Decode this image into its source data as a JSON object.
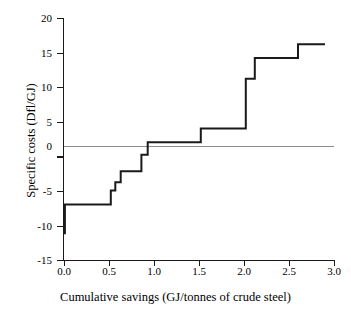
{
  "chart_data": {
    "type": "line",
    "subtype": "step-post",
    "title": "",
    "xlabel": "Cumulative savings (GJ/tonnes of crude steel)",
    "ylabel": "Specific costs (Dfl/GJ)",
    "xlim": [
      0.0,
      3.0
    ],
    "ylim": [
      -15,
      20
    ],
    "xticks": [
      "0.0",
      "0.5",
      "1.0",
      "1.5",
      "2.0",
      "2.5",
      "3.0"
    ],
    "xtick_values": [
      0.0,
      0.5,
      1.0,
      1.5,
      2.0,
      2.5,
      3.0
    ],
    "yticks": [
      "20",
      "15",
      "10",
      "5",
      "0",
      "-5",
      "-10",
      "-15"
    ],
    "ytick_values": [
      20,
      15,
      10,
      5,
      0,
      -5,
      -10,
      -15
    ],
    "grid": false,
    "legend": false,
    "zero_reference_line": true,
    "zero_reference_color": "#8c8c8c",
    "line_color": "#1a1a1a",
    "axis_color": "#1a1a1a",
    "background_color": "#ffffff",
    "steps": [
      {
        "x_start": 0.0,
        "x_end": 0.01,
        "y": -11.2
      },
      {
        "x_start": 0.01,
        "x_end": 0.52,
        "y": -7.0
      },
      {
        "x_start": 0.52,
        "x_end": 0.57,
        "y": -5.0
      },
      {
        "x_start": 0.57,
        "x_end": 0.63,
        "y": -3.8
      },
      {
        "x_start": 0.63,
        "x_end": 0.86,
        "y": -2.2
      },
      {
        "x_start": 0.86,
        "x_end": 0.93,
        "y": 0.2
      },
      {
        "x_start": 0.93,
        "x_end": 1.52,
        "y": 2.0
      },
      {
        "x_start": 1.52,
        "x_end": 2.02,
        "y": 4.0
      },
      {
        "x_start": 2.02,
        "x_end": 2.12,
        "y": 11.2
      },
      {
        "x_start": 2.12,
        "x_end": 2.6,
        "y": 14.2
      },
      {
        "x_start": 2.6,
        "x_end": 2.9,
        "y": 16.2
      }
    ],
    "x": [
      0.0,
      0.01,
      0.52,
      0.57,
      0.63,
      0.86,
      0.93,
      1.52,
      2.02,
      2.12,
      2.6,
      2.9
    ],
    "y": [
      -11.2,
      -7.0,
      -5.0,
      -3.8,
      -2.2,
      0.2,
      2.0,
      4.0,
      11.2,
      14.2,
      16.2,
      16.2
    ]
  }
}
